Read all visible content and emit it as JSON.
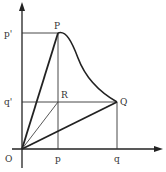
{
  "diagram": {
    "labels": {
      "P": "P",
      "Q": "Q",
      "R": "R",
      "O": "O",
      "p_prime": "p'",
      "q_prime": "q'",
      "p": "p",
      "q": "q"
    },
    "colors": {
      "line": "#222222",
      "thin_line": "#444444",
      "label": "#333333"
    },
    "points": {
      "O": [
        22,
        149
      ],
      "P": [
        58,
        33
      ],
      "Q": [
        117,
        102
      ],
      "R": [
        58,
        102
      ]
    }
  }
}
